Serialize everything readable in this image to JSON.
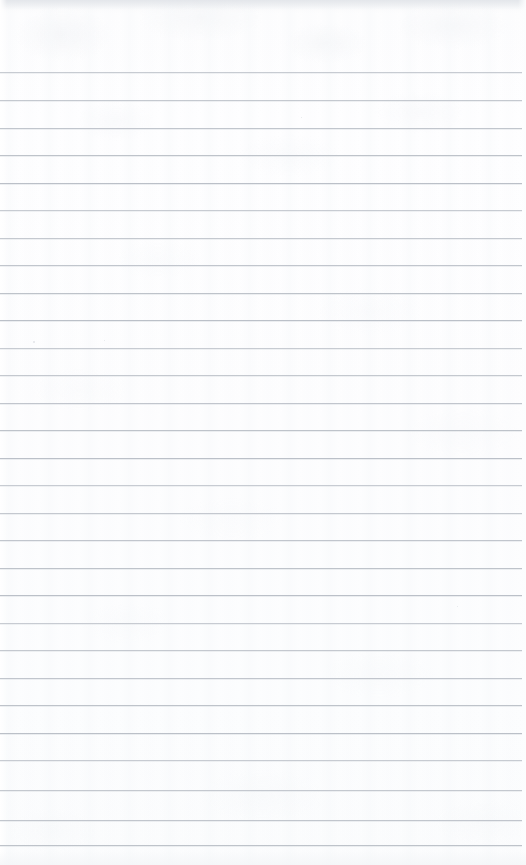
{
  "document": {
    "kind": "lined-notebook-page",
    "title": "Blank lined paper",
    "page_width": 526,
    "page_height": 865,
    "background_color": "#fdfdfe",
    "rule_color": "#b9bec6",
    "text_content": "",
    "header_area_label": "",
    "top_margin_px": 72,
    "rule_spacing_px": 27.6,
    "rule_count": 29,
    "rule_inset_left_px": 0,
    "rule_inset_right_px": 4,
    "has_vertical_margin_rule": false,
    "has_handwriting": false,
    "has_printed_text": false,
    "rules": [
      {
        "y": 72
      },
      {
        "y": 100
      },
      {
        "y": 128
      },
      {
        "y": 155
      },
      {
        "y": 183
      },
      {
        "y": 210
      },
      {
        "y": 238
      },
      {
        "y": 265
      },
      {
        "y": 293
      },
      {
        "y": 320
      },
      {
        "y": 348
      },
      {
        "y": 375
      },
      {
        "y": 403
      },
      {
        "y": 430
      },
      {
        "y": 458
      },
      {
        "y": 485
      },
      {
        "y": 513
      },
      {
        "y": 540
      },
      {
        "y": 568
      },
      {
        "y": 595
      },
      {
        "y": 623
      },
      {
        "y": 650
      },
      {
        "y": 678
      },
      {
        "y": 705
      },
      {
        "y": 733
      },
      {
        "y": 760
      },
      {
        "y": 790
      },
      {
        "y": 820
      },
      {
        "y": 845
      }
    ],
    "specks": [
      {
        "x": 33,
        "y": 341,
        "size": 2
      },
      {
        "x": 104,
        "y": 340,
        "size": 1
      },
      {
        "x": 301,
        "y": 117,
        "size": 1
      },
      {
        "x": 457,
        "y": 606,
        "size": 1
      }
    ]
  }
}
